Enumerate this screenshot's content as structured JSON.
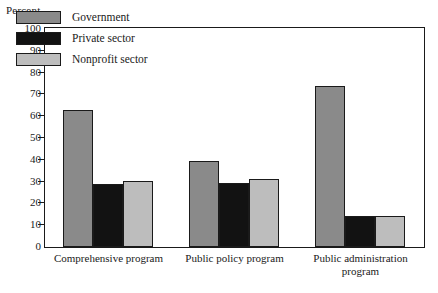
{
  "chart_data": {
    "type": "bar",
    "title": "",
    "subtitle": "",
    "ylabel": "Percent",
    "xlabel": "",
    "ylim": [
      0,
      100
    ],
    "ytick_step": 10,
    "yticks": [
      0,
      10,
      20,
      30,
      40,
      50,
      60,
      70,
      80,
      90,
      100
    ],
    "grid": false,
    "legend_position": "inside-top-left",
    "categories": [
      "Comprehensive program",
      "Public policy program",
      "Public administration program"
    ],
    "category_lines": [
      [
        "Comprehensive program"
      ],
      [
        "Public policy program"
      ],
      [
        "Public administration",
        "program"
      ]
    ],
    "series": [
      {
        "name": "Government",
        "color": "#8a8a8a",
        "values": [
          63,
          39.5,
          74
        ]
      },
      {
        "name": "Private sector",
        "color": "#121212",
        "values": [
          29,
          29.5,
          14
        ]
      },
      {
        "name": "Nonprofit sector",
        "color": "#bdbdbd",
        "values": [
          30.5,
          31,
          14
        ]
      }
    ]
  },
  "legend": {
    "items": [
      {
        "label": "Government",
        "swatch": "swatch-government"
      },
      {
        "label": "Private sector",
        "swatch": "swatch-private"
      },
      {
        "label": "Nonprofit sector",
        "swatch": "swatch-nonprofit"
      }
    ]
  }
}
